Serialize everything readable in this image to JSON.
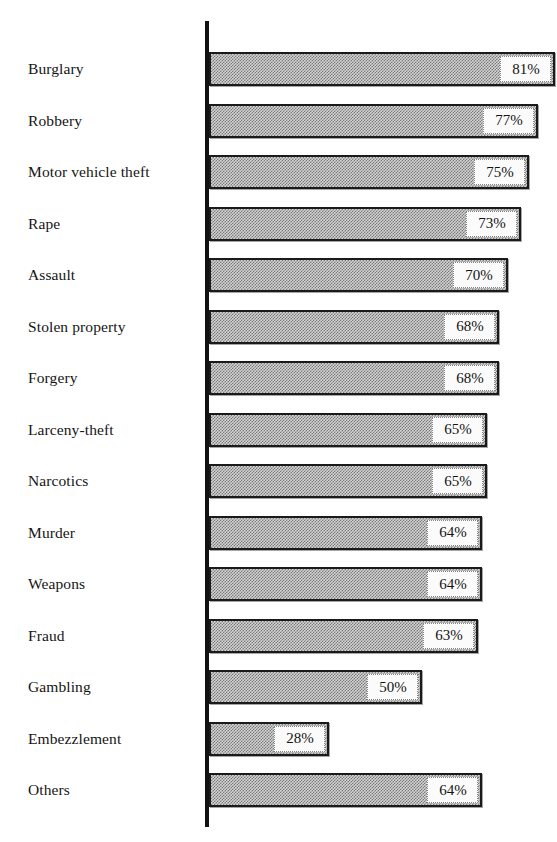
{
  "chart_data": {
    "type": "bar",
    "orientation": "horizontal",
    "title": "",
    "subtitle": "",
    "xlabel": "",
    "ylabel": "",
    "xlim": [
      0,
      100
    ],
    "grid": false,
    "legend": null,
    "value_suffix": "%",
    "categories": [
      "Burglary",
      "Robbery",
      "Motor vehicle theft",
      "Rape",
      "Assault",
      "Stolen property",
      "Forgery",
      "Larceny-theft",
      "Narcotics",
      "Murder",
      "Weapons",
      "Fraud",
      "Gambling",
      "Embezzlement",
      "Others"
    ],
    "values": [
      81,
      77,
      75,
      73,
      70,
      68,
      68,
      65,
      65,
      64,
      64,
      63,
      50,
      28,
      64
    ],
    "labels": [
      "81%",
      "77%",
      "75%",
      "73%",
      "70%",
      "68%",
      "68%",
      "65%",
      "65%",
      "64%",
      "64%",
      "63%",
      "50%",
      "28%",
      "64%"
    ],
    "series": [
      {
        "name": "",
        "values": [
          81,
          77,
          75,
          73,
          70,
          68,
          68,
          65,
          65,
          64,
          64,
          63,
          50,
          28,
          64
        ]
      }
    ]
  },
  "style": {
    "background_color": "#ffffff",
    "bar_fill_color": "#d2d2d2",
    "bar_pattern_color": "#7a7a7a",
    "bar_border_color": "#1a1a1a",
    "axis_color": "#121212",
    "text_color": "#151515",
    "value_box_color": "#fbfbfb"
  },
  "geometry": {
    "axis_x": 205,
    "axis_top": 21,
    "axis_bottom": 827,
    "bar_origin_x": 209,
    "first_bar_top": 52,
    "bar_height": 34,
    "row_pitch": 51.5,
    "px_per_percent": 4.27
  }
}
